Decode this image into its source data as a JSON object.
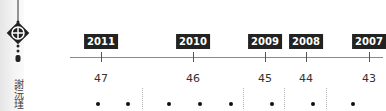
{
  "sidebar": {
    "ornament_icon": "knot-pendant-icon",
    "vertical_title": "謝沅瑾"
  },
  "timeline": {
    "items": [
      {
        "year": "2011",
        "age": "47",
        "x": 101
      },
      {
        "year": "2010",
        "age": "46",
        "x": 193
      },
      {
        "year": "2009",
        "age": "45",
        "x": 265
      },
      {
        "year": "2008",
        "age": "44",
        "x": 306
      },
      {
        "year": "2007",
        "age": "43",
        "x": 369
      }
    ],
    "dots_x": [
      98,
      128,
      169,
      200,
      231,
      272,
      313,
      353
    ],
    "separators_x": [
      142,
      243,
      284,
      326
    ]
  }
}
